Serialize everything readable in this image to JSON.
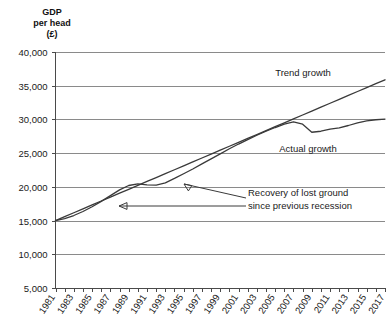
{
  "chart_data": {
    "type": "line",
    "title": "GDP per head (£)",
    "title_lines": [
      "GDP",
      "per head",
      "(£)"
    ],
    "xlabel": "",
    "ylabel": "GDP per head (£)",
    "ylim": [
      5000,
      40000
    ],
    "xlim": [
      1981,
      2017
    ],
    "grid": true,
    "legend_position": "inline-annotations",
    "ytick_labels": [
      "40,000",
      "35,000",
      "30,000",
      "25,000",
      "20,000",
      "15,000",
      "10,000",
      "5,000"
    ],
    "ytick_values": [
      40000,
      35000,
      30000,
      25000,
      20000,
      15000,
      10000,
      5000
    ],
    "xtick_labels": [
      "1981",
      "1983",
      "1985",
      "1987",
      "1989",
      "1991",
      "1993",
      "1995",
      "1997",
      "1999",
      "2001",
      "2003",
      "2005",
      "2007",
      "2009",
      "2011",
      "2013",
      "2015",
      "2017"
    ],
    "xtick_values": [
      1981,
      1983,
      1985,
      1987,
      1989,
      1991,
      1993,
      1995,
      1997,
      1999,
      2001,
      2003,
      2005,
      2007,
      2009,
      2011,
      2013,
      2015,
      2017
    ],
    "x": [
      1981,
      1982,
      1983,
      1984,
      1985,
      1986,
      1987,
      1988,
      1989,
      1990,
      1991,
      1992,
      1993,
      1994,
      1995,
      1996,
      1997,
      1998,
      1999,
      2000,
      2001,
      2002,
      2003,
      2004,
      2005,
      2006,
      2007,
      2008,
      2009,
      2010,
      2011,
      2012,
      2013,
      2014,
      2015,
      2016,
      2017
    ],
    "series": [
      {
        "name": "Trend growth",
        "values": [
          15000,
          15580,
          16160,
          16740,
          17320,
          17900,
          18480,
          19060,
          19640,
          20220,
          20800,
          21380,
          21960,
          22540,
          23120,
          23700,
          24280,
          24860,
          25440,
          26020,
          26600,
          27180,
          27760,
          28340,
          28920,
          29500,
          30080,
          30660,
          31240,
          31820,
          32400,
          32980,
          33560,
          34140,
          34720,
          35300,
          35880
        ]
      },
      {
        "name": "Actual growth",
        "values": [
          15000,
          15300,
          15750,
          16350,
          17050,
          17850,
          18700,
          19550,
          20200,
          20450,
          20300,
          20250,
          20600,
          21250,
          21950,
          22650,
          23400,
          24150,
          24900,
          25650,
          26350,
          27000,
          27650,
          28250,
          28800,
          29300,
          29650,
          29300,
          28100,
          28250,
          28550,
          28750,
          29100,
          29500,
          29800,
          29950,
          30050
        ]
      }
    ],
    "annotations": [
      {
        "id": "trend-growth-label",
        "text": "Trend growth",
        "x": 303,
        "y": 76,
        "anchor": "middle"
      },
      {
        "id": "actual-growth-label",
        "text": "Actual growth",
        "x": 308,
        "y": 152,
        "anchor": "middle"
      },
      {
        "id": "recovery-label-line1",
        "text": "Recovery of lost ground",
        "x": 248,
        "y": 196,
        "anchor": "start"
      },
      {
        "id": "recovery-label-line2",
        "text": "since previous recession",
        "x": 248,
        "y": 209,
        "anchor": "start"
      }
    ]
  }
}
